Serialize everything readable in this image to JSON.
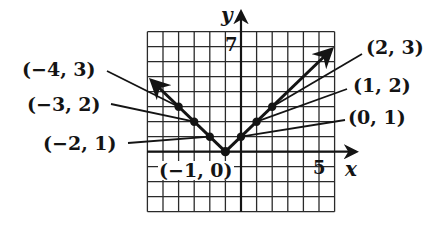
{
  "figure": {
    "function": "y = |x + 1|",
    "axes": {
      "x_label": "x",
      "y_label": "y",
      "x_tick_label": "5",
      "y_tick_label": "7",
      "x_range": [
        -6,
        6
      ],
      "y_range": [
        -4,
        8
      ]
    },
    "point_labels": {
      "p1": "(−4, 3)",
      "p2": "(−3, 2)",
      "p3": "(−2, 1)",
      "p4": "(−1, 0)",
      "p5": "(0, 1)",
      "p6": "(1, 2)",
      "p7": "(2, 3)"
    },
    "colors": {
      "ink": "#141414",
      "grid": "#2a2a2a",
      "background": "#ffffff"
    }
  },
  "chart_data": {
    "type": "line",
    "title": "",
    "xlabel": "x",
    "ylabel": "y",
    "xlim": [
      -6,
      6
    ],
    "ylim": [
      -4,
      8
    ],
    "grid": true,
    "series": [
      {
        "name": "y = |x + 1|",
        "points": [
          [
            -4,
            3
          ],
          [
            -3,
            2
          ],
          [
            -2,
            1
          ],
          [
            -1,
            0
          ],
          [
            0,
            1
          ],
          [
            1,
            2
          ],
          [
            2,
            3
          ]
        ]
      }
    ],
    "annotations": [
      "(−4, 3)",
      "(−3, 2)",
      "(−2, 1)",
      "(−1, 0)",
      "(0, 1)",
      "(1, 2)",
      "(2, 3)",
      "7",
      "5"
    ]
  }
}
